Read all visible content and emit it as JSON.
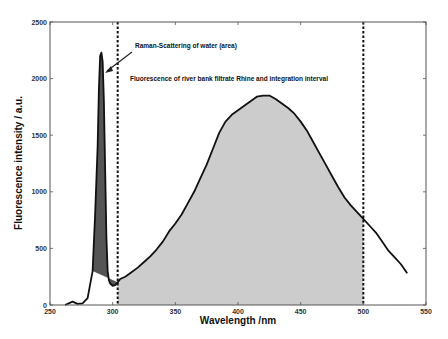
{
  "chart_data": {
    "type": "line",
    "title": "",
    "xlabel": "Wavelength /nm",
    "ylabel": "Fluorescence intensity / a.u.",
    "xlim": [
      250,
      550
    ],
    "ylim": [
      0,
      2500
    ],
    "x_ticks": [
      250,
      300,
      350,
      400,
      450,
      500,
      550
    ],
    "y_ticks": [
      0,
      500,
      1000,
      1500,
      2000,
      2500
    ],
    "grid": false,
    "legend": null,
    "series": [
      {
        "name": "Fluorescence spectrum",
        "x": [
          262,
          268,
          272,
          276,
          280,
          284,
          286,
          288,
          289,
          290,
          291,
          292,
          293,
          294,
          295,
          296,
          297,
          298,
          300,
          302,
          304,
          306,
          310,
          315,
          320,
          325,
          330,
          335,
          340,
          345,
          350,
          355,
          360,
          365,
          370,
          375,
          380,
          385,
          390,
          395,
          400,
          405,
          410,
          415,
          420,
          425,
          430,
          435,
          440,
          445,
          450,
          455,
          460,
          465,
          470,
          475,
          480,
          485,
          490,
          495,
          500,
          505,
          510,
          515,
          520,
          525,
          530,
          535
        ],
        "y": [
          0,
          30,
          10,
          15,
          60,
          300,
          800,
          1400,
          1900,
          2200,
          2230,
          2150,
          1800,
          1200,
          600,
          300,
          220,
          190,
          170,
          175,
          200,
          230,
          250,
          290,
          330,
          380,
          430,
          490,
          560,
          650,
          720,
          800,
          900,
          1000,
          1120,
          1240,
          1380,
          1520,
          1620,
          1680,
          1720,
          1760,
          1800,
          1840,
          1850,
          1850,
          1820,
          1780,
          1740,
          1690,
          1620,
          1540,
          1440,
          1340,
          1240,
          1140,
          1040,
          950,
          880,
          820,
          760,
          700,
          640,
          560,
          480,
          420,
          360,
          280
        ]
      }
    ],
    "shaded_regions": [
      {
        "name": "Raman-Scattering of water (area)",
        "x_start": 284,
        "x_end": 304,
        "color": "#555555"
      },
      {
        "name": "Fluorescence integration interval",
        "x_start": 304,
        "x_end": 500,
        "color": "#cccccc"
      }
    ],
    "vertical_lines": [
      {
        "x": 304,
        "style": "dashed"
      },
      {
        "x": 500,
        "style": "dashed"
      }
    ],
    "annotations": [
      {
        "text": "Raman-Scattering of water (area)",
        "arrow_to": [
          292,
          1950
        ]
      },
      {
        "text": "Fluorescence of river bank filtrate Rhine and integration interval"
      }
    ]
  },
  "labels": {
    "xlabel": "Wavelength /nm",
    "ylabel": "Fluorescence intensity / a.u.",
    "annot_raman": "Raman-Scattering of water (area)",
    "annot_fluor": "Fluorescence of river bank filtrate Rhine and integration interval",
    "x_tick_labels": [
      "250",
      "300",
      "350",
      "400",
      "450",
      "500",
      "550"
    ],
    "y_tick_labels": [
      "0",
      "500",
      "1000",
      "1500",
      "2000",
      "2500"
    ]
  }
}
